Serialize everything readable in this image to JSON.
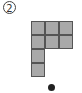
{
  "figure": {
    "label": "2",
    "cell_size": 14,
    "cells": [
      {
        "row": 0,
        "col": 0
      },
      {
        "row": 0,
        "col": 1
      },
      {
        "row": 0,
        "col": 2
      },
      {
        "row": 1,
        "col": 0
      },
      {
        "row": 1,
        "col": 1
      },
      {
        "row": 1,
        "col": 2
      },
      {
        "row": 2,
        "col": 0
      },
      {
        "row": 3,
        "col": 0
      }
    ],
    "dot": {
      "x": 48,
      "y": 84
    },
    "colors": {
      "cell_fill": "#a9a9a9",
      "cell_border": "#555555",
      "dot": "#222222"
    }
  }
}
